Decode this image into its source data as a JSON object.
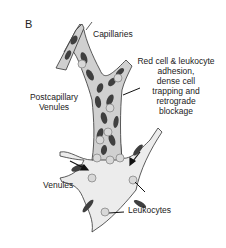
{
  "figure": {
    "panel_label": "B",
    "labels": {
      "capillaries": "Capillaries",
      "annotation_lines": [
        "Red cell & leukocyte",
        "adhesion,",
        "dense cell",
        "trapping and",
        "retrograde",
        "blockage"
      ],
      "postcapillary_lines": [
        "Postcapillary",
        "Venules"
      ],
      "venules": "Venules",
      "leukocytes": "Leukocytes"
    },
    "colors": {
      "vessel_fill": "#ececec",
      "vessel_outline": "#333333",
      "red_cell": "#4a4a4a",
      "leukocyte_fill": "#d8d8d8",
      "leukocyte_stroke": "#888888",
      "text": "#222222"
    }
  }
}
